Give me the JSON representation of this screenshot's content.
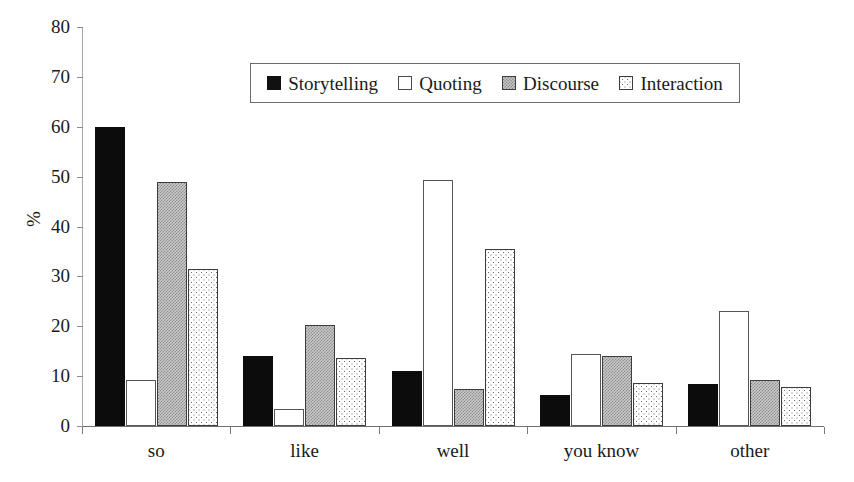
{
  "chart_data": {
    "type": "bar",
    "title": "",
    "xlabel": "",
    "ylabel": "%",
    "ylim": [
      0,
      80
    ],
    "yticks": [
      0,
      10,
      20,
      30,
      40,
      50,
      60,
      70,
      80
    ],
    "grid": false,
    "legend_position": "top-center",
    "categories": [
      "so",
      "like",
      "well",
      "you know",
      "other"
    ],
    "series": [
      {
        "name": "Storytelling",
        "pattern": "solid-black",
        "color": "#0c0c0c",
        "values": [
          60.0,
          14.0,
          11.0,
          6.2,
          8.5
        ]
      },
      {
        "name": "Quoting",
        "pattern": "empty-white",
        "color": "#ffffff",
        "values": [
          9.3,
          3.4,
          49.3,
          14.5,
          23.0
        ]
      },
      {
        "name": "Discourse",
        "pattern": "gray-checker",
        "color": "#b0b0b0",
        "values": [
          49.0,
          20.2,
          7.5,
          14.0,
          9.3
        ]
      },
      {
        "name": "Interaction",
        "pattern": "dotted",
        "color": "#ffffff",
        "values": [
          31.5,
          13.7,
          35.5,
          8.7,
          7.8
        ]
      }
    ]
  },
  "axis": {
    "y_label": "%",
    "y_tick_labels": [
      "0",
      "10",
      "20",
      "30",
      "40",
      "50",
      "60",
      "70",
      "80"
    ],
    "x_tick_labels": [
      "so",
      "like",
      "well",
      "you know",
      "other"
    ]
  },
  "legend": {
    "entries": [
      {
        "label": "Storytelling"
      },
      {
        "label": "Quoting"
      },
      {
        "label": "Discourse"
      },
      {
        "label": "Interaction"
      }
    ]
  }
}
